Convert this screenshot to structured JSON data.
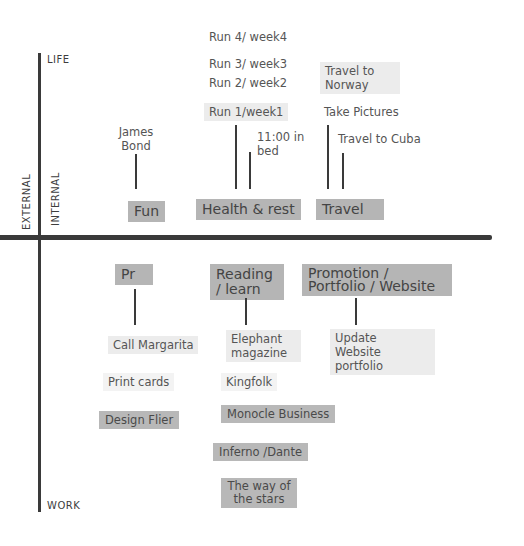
{
  "axes": {
    "top": "LIFE",
    "bottom": "WORK",
    "left": "EXTERNAL",
    "right": "INTERNAL"
  },
  "life_categories": [
    {
      "label": "Fun",
      "items": [
        "James Bond"
      ]
    },
    {
      "label": "Health & rest",
      "items": [
        "Run 1/week1",
        "Run 2/ week2",
        "Run 3/ week3",
        "Run 4/ week4",
        "11:00 in bed"
      ]
    },
    {
      "label": "Travel",
      "items": [
        "Take Pictures",
        "Travel to Norway",
        "Travel to Cuba"
      ]
    }
  ],
  "work_categories": [
    {
      "label": "Pr",
      "items": [
        "Call Margarita",
        "Print cards",
        "Design Flier"
      ]
    },
    {
      "label": "Reading / learn",
      "items": [
        "Elephant magazine",
        "Kingfolk",
        "Monocle Business",
        "Inferno /Dante",
        "The way of the stars"
      ]
    },
    {
      "label": "Promotion / Portfolio / Website",
      "items": [
        "Update Website portfolio"
      ]
    }
  ],
  "colors": {
    "axis": "#3a3a3a",
    "highlight_dark": "#b5b5b5",
    "highlight_light": "#ececec",
    "text": "#555555"
  }
}
